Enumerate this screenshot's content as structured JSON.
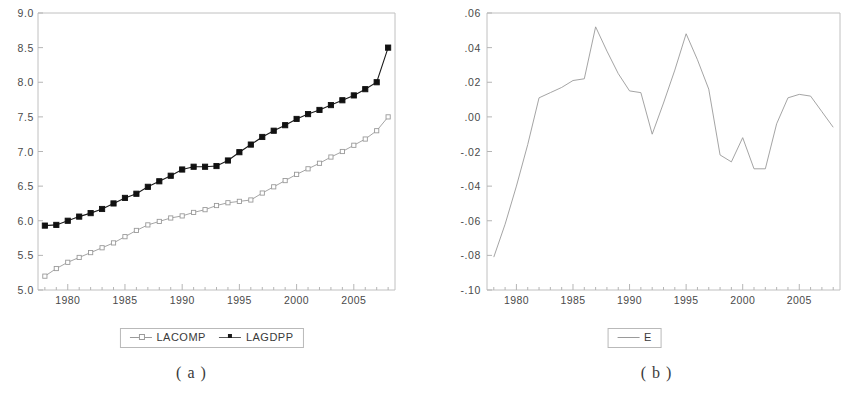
{
  "figure": {
    "panels": [
      {
        "id": "panel-a",
        "caption": "( a )",
        "legend": [
          {
            "label": "LACOMP",
            "marker": "hollow-square",
            "color": "#9a9a9a"
          },
          {
            "label": "LAGDPP",
            "marker": "solid-square",
            "color": "#1a1a1a"
          }
        ]
      },
      {
        "id": "panel-b",
        "caption": "( b )",
        "legend": [
          {
            "label": "E",
            "marker": "none",
            "color": "#9a9a9a"
          }
        ]
      }
    ]
  },
  "chart_data": [
    {
      "type": "line",
      "title": "",
      "subtitle": "",
      "xlabel": "",
      "ylabel": "",
      "grid": false,
      "legend_position": "bottom",
      "xlim": [
        1977.4,
        2008.6
      ],
      "ylim": [
        5.0,
        9.0
      ],
      "ytick_labels": [
        "9.0",
        "8.5",
        "8.0",
        "7.5",
        "7.0",
        "6.5",
        "6.0",
        "5.5",
        "5.0"
      ],
      "ytick_values": [
        9.0,
        8.5,
        8.0,
        7.5,
        7.0,
        6.5,
        6.0,
        5.5,
        5.0
      ],
      "xtick_labels": [
        "1980",
        "1985",
        "1990",
        "1995",
        "2000",
        "2005"
      ],
      "xtick_values": [
        1980,
        1985,
        1990,
        1995,
        2000,
        2005
      ],
      "x": [
        1978,
        1979,
        1980,
        1981,
        1982,
        1983,
        1984,
        1985,
        1986,
        1987,
        1988,
        1989,
        1990,
        1991,
        1992,
        1993,
        1994,
        1995,
        1996,
        1997,
        1998,
        1999,
        2000,
        2001,
        2002,
        2003,
        2004,
        2005,
        2006,
        2007,
        2008
      ],
      "series": [
        {
          "name": "LACOMP",
          "marker": "hollow-square",
          "color": "#9a9a9a",
          "values": [
            5.2,
            5.31,
            5.4,
            5.47,
            5.54,
            5.61,
            5.68,
            5.77,
            5.86,
            5.94,
            5.99,
            6.04,
            6.07,
            6.12,
            6.16,
            6.22,
            6.26,
            6.28,
            6.3,
            6.4,
            6.49,
            6.58,
            6.67,
            6.75,
            6.83,
            6.92,
            7.0,
            7.09,
            7.18,
            7.3,
            7.5
          ]
        },
        {
          "name": "LAGDPP",
          "marker": "solid-square",
          "color": "#1a1a1a",
          "values": [
            5.93,
            5.94,
            6.0,
            6.06,
            6.11,
            6.17,
            6.25,
            6.33,
            6.39,
            6.49,
            6.57,
            6.65,
            6.74,
            6.78,
            6.78,
            6.79,
            6.87,
            6.99,
            7.1,
            7.21,
            7.3,
            7.38,
            7.47,
            7.54,
            7.6,
            7.67,
            7.74,
            7.81,
            7.9,
            8.0,
            8.5
          ]
        }
      ]
    },
    {
      "type": "line",
      "title": "",
      "subtitle": "",
      "xlabel": "",
      "ylabel": "",
      "grid": false,
      "legend_position": "bottom",
      "xlim": [
        1977.4,
        2008.6
      ],
      "ylim": [
        -0.1,
        0.06
      ],
      "ytick_labels": [
        ".06",
        ".04",
        ".02",
        ".00",
        "-.02",
        "-.04",
        "-.06",
        "-.08",
        "-.10"
      ],
      "ytick_values": [
        0.06,
        0.04,
        0.02,
        0.0,
        -0.02,
        -0.04,
        -0.06,
        -0.08,
        -0.1
      ],
      "xtick_labels": [
        "1980",
        "1985",
        "1990",
        "1995",
        "2000",
        "2005"
      ],
      "xtick_values": [
        1980,
        1985,
        1990,
        1995,
        2000,
        2005
      ],
      "x": [
        1978,
        1979,
        1980,
        1981,
        1982,
        1983,
        1984,
        1985,
        1986,
        1987,
        1988,
        1989,
        1990,
        1991,
        1992,
        1993,
        1994,
        1995,
        1996,
        1997,
        1998,
        1999,
        2000,
        2001,
        2002,
        2003,
        2004,
        2005,
        2006,
        2007,
        2008
      ],
      "series": [
        {
          "name": "E",
          "marker": "none",
          "color": "#9a9a9a",
          "values": [
            -0.081,
            -0.062,
            -0.04,
            -0.016,
            0.011,
            0.014,
            0.017,
            0.021,
            0.022,
            0.052,
            0.038,
            0.025,
            0.015,
            0.014,
            -0.01,
            0.008,
            0.027,
            0.048,
            0.033,
            0.016,
            -0.022,
            -0.026,
            -0.012,
            -0.03,
            -0.03,
            -0.004,
            0.011,
            0.013,
            0.012,
            0.003,
            -0.006
          ]
        }
      ]
    }
  ]
}
